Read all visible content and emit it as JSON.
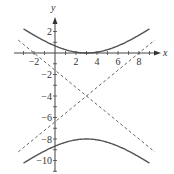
{
  "chart_data": {
    "type": "line",
    "title": "",
    "xlabel": "x",
    "ylabel": "y",
    "xlim": [
      -3.5,
      9.5
    ],
    "ylim": [
      -11,
      3
    ],
    "x_ticks": [
      -2,
      2,
      4,
      6,
      8
    ],
    "y_ticks": [
      2,
      -2,
      -4,
      -6,
      -8,
      -10
    ],
    "x_tick_labels": [
      "−2",
      "2",
      "4",
      "6",
      "8"
    ],
    "y_tick_labels": [
      "2",
      "−2",
      "−4",
      "−6",
      "−8",
      "−10"
    ],
    "grid": false,
    "legend": null,
    "equation": "(y+4)^2/16 - (x-3)^2/25 = 1",
    "center": [
      3,
      -4
    ],
    "vertices": [
      [
        3,
        0
      ],
      [
        3,
        -8
      ]
    ],
    "series": [
      {
        "name": "upper branch",
        "style": "solid",
        "x": [
          -3,
          -2,
          -1,
          0,
          1,
          2,
          3,
          4,
          5,
          6,
          7,
          8,
          9
        ],
        "y": [
          2.25,
          1.12,
          0.1,
          -0.67,
          -0.86,
          -0.92,
          0,
          -0.92,
          -0.86,
          -0.67,
          0.1,
          1.12,
          2.25
        ]
      },
      {
        "name": "lower branch",
        "style": "solid",
        "x": [
          -3,
          -1,
          1,
          3,
          5,
          7,
          9
        ],
        "y": [
          -10.25,
          -8.69,
          -8.04,
          -8,
          -8.04,
          -8.69,
          -10.25
        ]
      },
      {
        "name": "asymptote 1",
        "style": "dashed",
        "x": [
          -3.5,
          9.5
        ],
        "y": [
          1.2,
          -9.2
        ]
      },
      {
        "name": "asymptote 2",
        "style": "dashed",
        "x": [
          -3.5,
          9.5
        ],
        "y": [
          -9.2,
          1.2
        ]
      }
    ]
  },
  "axes": {
    "x_label": "x",
    "y_label": "y"
  }
}
